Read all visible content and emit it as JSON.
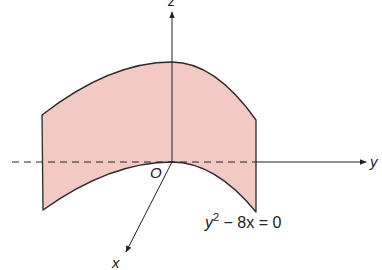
{
  "figure": {
    "type": "3d-surface-sketch",
    "surface": {
      "name": "parabolic cylinder",
      "equation_parts": {
        "base": "y",
        "exp": "2",
        "rest": " − 8x = 0"
      },
      "fill_color": "#f2c9c3",
      "edge_color": "#2a2a2a"
    },
    "axes": {
      "x": {
        "label": "x"
      },
      "y": {
        "label": "y"
      },
      "z": {
        "label": "z"
      },
      "origin_label": "O",
      "axis_color": "#222222"
    }
  }
}
